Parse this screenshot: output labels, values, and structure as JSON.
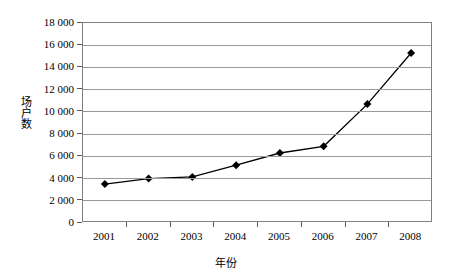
{
  "chart_data": {
    "type": "line",
    "title": "",
    "xlabel": "年份",
    "ylabel": "场户数",
    "categories": [
      "2001",
      "2002",
      "2003",
      "2004",
      "2005",
      "2006",
      "2007",
      "2008"
    ],
    "series": [
      {
        "name": "场户数",
        "values": [
          3500,
          4000,
          4150,
          5200,
          6300,
          6900,
          10700,
          15300
        ],
        "color": "#000000",
        "marker": "diamond"
      }
    ],
    "ylim": [
      0,
      18000
    ],
    "yticks": [
      0,
      2000,
      4000,
      6000,
      8000,
      10000,
      12000,
      14000,
      16000,
      18000
    ],
    "ytick_labels": [
      "0",
      "2 000",
      "4 000",
      "6 000",
      "8 000",
      "10 000",
      "12 000",
      "14 000",
      "16 000",
      "18 000"
    ],
    "grid": "horizontal",
    "legend": "none",
    "plot_border_color": "#7f7f7f",
    "gridline_color": "#9a9a9a"
  }
}
